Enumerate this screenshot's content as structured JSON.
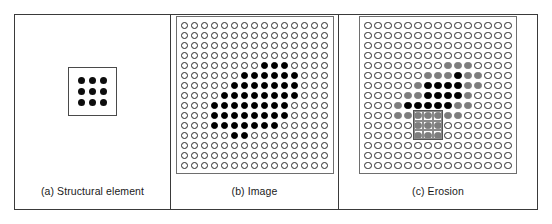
{
  "figure": {
    "background": "#ffffff",
    "border_color": "#3a3a3a"
  },
  "colors": {
    "empty_dot_outline": "#2b2b2b",
    "filled_dot": "#000000",
    "eroded_dot_gray": "#7d7d7d",
    "frame": "#6e6e6e",
    "overlay_box": "#555555",
    "text": "#1a1a1a"
  },
  "panels": [
    {
      "id": "structural-element",
      "caption": "(a) Structural element",
      "kind": "structuring-element",
      "rows": 3,
      "cols": 3,
      "cells": [
        [
          "filled",
          "filled",
          "filled"
        ],
        [
          "filled",
          "filled",
          "filled"
        ],
        [
          "filled",
          "filled",
          "filled"
        ]
      ]
    },
    {
      "id": "image",
      "caption": "(b) Image",
      "kind": "grid",
      "rows": 15,
      "cols": 15,
      "cells": [
        [
          "e",
          "e",
          "e",
          "e",
          "e",
          "e",
          "e",
          "e",
          "e",
          "e",
          "e",
          "e",
          "e",
          "e",
          "e"
        ],
        [
          "e",
          "e",
          "e",
          "e",
          "e",
          "e",
          "e",
          "e",
          "e",
          "e",
          "e",
          "e",
          "e",
          "e",
          "e"
        ],
        [
          "e",
          "e",
          "e",
          "e",
          "e",
          "e",
          "e",
          "e",
          "e",
          "e",
          "e",
          "e",
          "e",
          "e",
          "e"
        ],
        [
          "e",
          "e",
          "e",
          "e",
          "e",
          "e",
          "e",
          "e",
          "e",
          "e",
          "e",
          "e",
          "e",
          "e",
          "e"
        ],
        [
          "e",
          "e",
          "e",
          "e",
          "e",
          "e",
          "e",
          "e",
          "f",
          "f",
          "f",
          "e",
          "e",
          "e",
          "e"
        ],
        [
          "e",
          "e",
          "e",
          "e",
          "e",
          "e",
          "f",
          "f",
          "f",
          "f",
          "f",
          "f",
          "e",
          "e",
          "e"
        ],
        [
          "e",
          "e",
          "e",
          "e",
          "e",
          "f",
          "f",
          "f",
          "f",
          "f",
          "f",
          "f",
          "e",
          "e",
          "e"
        ],
        [
          "e",
          "e",
          "e",
          "e",
          "f",
          "f",
          "f",
          "f",
          "f",
          "f",
          "f",
          "f",
          "e",
          "e",
          "e"
        ],
        [
          "e",
          "e",
          "e",
          "f",
          "f",
          "f",
          "f",
          "f",
          "f",
          "f",
          "f",
          "e",
          "e",
          "e",
          "e"
        ],
        [
          "e",
          "e",
          "e",
          "f",
          "f",
          "f",
          "f",
          "f",
          "f",
          "f",
          "f",
          "e",
          "e",
          "e",
          "e"
        ],
        [
          "e",
          "e",
          "e",
          "f",
          "f",
          "f",
          "f",
          "f",
          "f",
          "f",
          "e",
          "e",
          "e",
          "e",
          "e"
        ],
        [
          "e",
          "e",
          "e",
          "e",
          "e",
          "f",
          "f",
          "e",
          "e",
          "e",
          "e",
          "e",
          "e",
          "e",
          "e"
        ],
        [
          "e",
          "e",
          "e",
          "e",
          "e",
          "e",
          "e",
          "e",
          "e",
          "e",
          "e",
          "e",
          "e",
          "e",
          "e"
        ],
        [
          "e",
          "e",
          "e",
          "e",
          "e",
          "e",
          "e",
          "e",
          "e",
          "e",
          "e",
          "e",
          "e",
          "e",
          "e"
        ],
        [
          "e",
          "e",
          "e",
          "e",
          "e",
          "e",
          "e",
          "e",
          "e",
          "e",
          "e",
          "e",
          "e",
          "e",
          "e"
        ]
      ]
    },
    {
      "id": "erosion",
      "caption": "(c) Erosion",
      "kind": "grid",
      "rows": 15,
      "cols": 15,
      "overlay": {
        "name": "structuring-element-overlay",
        "row": 9,
        "col": 5,
        "size": 3
      },
      "cells": [
        [
          "e",
          "e",
          "e",
          "e",
          "e",
          "e",
          "e",
          "e",
          "e",
          "e",
          "e",
          "e",
          "e",
          "e",
          "e"
        ],
        [
          "e",
          "e",
          "e",
          "e",
          "e",
          "e",
          "e",
          "e",
          "e",
          "e",
          "e",
          "e",
          "e",
          "e",
          "e"
        ],
        [
          "e",
          "e",
          "e",
          "e",
          "e",
          "e",
          "e",
          "e",
          "e",
          "e",
          "e",
          "e",
          "e",
          "e",
          "e"
        ],
        [
          "e",
          "e",
          "e",
          "e",
          "e",
          "e",
          "e",
          "e",
          "e",
          "e",
          "e",
          "e",
          "e",
          "e",
          "e"
        ],
        [
          "e",
          "e",
          "e",
          "e",
          "e",
          "e",
          "e",
          "e",
          "g",
          "g",
          "g",
          "e",
          "e",
          "e",
          "e"
        ],
        [
          "e",
          "e",
          "e",
          "e",
          "e",
          "e",
          "g",
          "g",
          "g",
          "f",
          "g",
          "g",
          "e",
          "e",
          "e"
        ],
        [
          "e",
          "e",
          "e",
          "e",
          "e",
          "g",
          "f",
          "f",
          "f",
          "f",
          "g",
          "g",
          "e",
          "e",
          "e"
        ],
        [
          "e",
          "e",
          "e",
          "e",
          "g",
          "g",
          "f",
          "f",
          "f",
          "f",
          "g",
          "e",
          "e",
          "e",
          "e"
        ],
        [
          "e",
          "e",
          "e",
          "g",
          "f",
          "f",
          "f",
          "f",
          "f",
          "g",
          "g",
          "e",
          "e",
          "e",
          "e"
        ],
        [
          "e",
          "e",
          "e",
          "g",
          "g",
          "g",
          "g",
          "g",
          "g",
          "g",
          "e",
          "e",
          "e",
          "e",
          "e"
        ],
        [
          "e",
          "e",
          "e",
          "e",
          "e",
          "g",
          "g",
          "g",
          "e",
          "e",
          "e",
          "e",
          "e",
          "e",
          "e"
        ],
        [
          "e",
          "e",
          "e",
          "e",
          "e",
          "g",
          "g",
          "g",
          "e",
          "e",
          "e",
          "e",
          "e",
          "e",
          "e"
        ],
        [
          "e",
          "e",
          "e",
          "e",
          "e",
          "e",
          "e",
          "e",
          "e",
          "e",
          "e",
          "e",
          "e",
          "e",
          "e"
        ],
        [
          "e",
          "e",
          "e",
          "e",
          "e",
          "e",
          "e",
          "e",
          "e",
          "e",
          "e",
          "e",
          "e",
          "e",
          "e"
        ],
        [
          "e",
          "e",
          "e",
          "e",
          "e",
          "e",
          "e",
          "e",
          "e",
          "e",
          "e",
          "e",
          "e",
          "e",
          "e"
        ]
      ]
    }
  ]
}
